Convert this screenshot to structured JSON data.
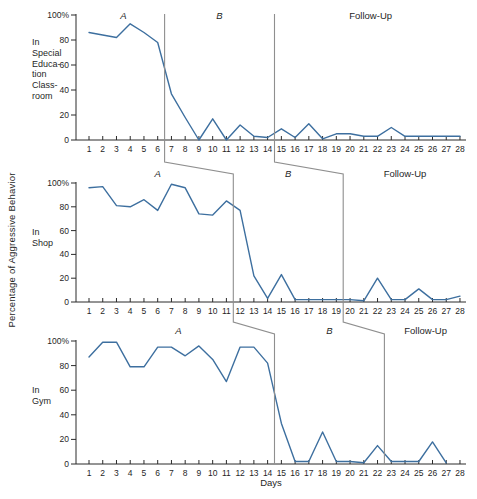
{
  "chart_data": {
    "type": "line",
    "title": "",
    "xlabel": "Days",
    "ylabel": "Percentage of Aggressive Behavior",
    "ylim": [
      0,
      100
    ],
    "grid": false,
    "legend": "none",
    "x_days": [
      1,
      2,
      3,
      4,
      5,
      6,
      7,
      8,
      9,
      10,
      11,
      12,
      13,
      14,
      15,
      16,
      17,
      18,
      19,
      20,
      21,
      22,
      23,
      24,
      25,
      26,
      27,
      28
    ],
    "y_ticks": [
      {
        "label": "100%",
        "value": 100
      },
      {
        "label": "80",
        "value": 80
      },
      {
        "label": "60",
        "value": 60
      },
      {
        "label": "40",
        "value": 40
      },
      {
        "label": "20",
        "value": 20
      },
      {
        "label": "0",
        "value": 0
      }
    ],
    "colors": {
      "line": "#3d6f9f",
      "axis": "#2b2b2b",
      "phase_line": "#8f8f8f",
      "text": "#1f1f1f",
      "background": "#ffffff"
    },
    "panels": [
      {
        "setting_label": "In\nSpecial\nEduca-\ntion\nClass-\nroom",
        "phases": [
          {
            "label": "A",
            "start_day": 1,
            "end_day": 6
          },
          {
            "label": "B",
            "start_day": 7,
            "end_day": 14
          },
          {
            "label": "Follow-Up",
            "start_day": 15,
            "end_day": 28
          }
        ],
        "phase_boundaries_after_day": [
          6,
          14
        ],
        "values": [
          86,
          84,
          82,
          93,
          86,
          78,
          37,
          18,
          0,
          17,
          0,
          12,
          3,
          2,
          9,
          2,
          13,
          1,
          5,
          5,
          3,
          3,
          10,
          3,
          3,
          3,
          3,
          3
        ]
      },
      {
        "setting_label": "In\nShop",
        "phases": [
          {
            "label": "A",
            "start_day": 1,
            "end_day": 11
          },
          {
            "label": "B",
            "start_day": 12,
            "end_day": 19
          },
          {
            "label": "Follow-Up",
            "start_day": 20,
            "end_day": 28
          }
        ],
        "phase_boundaries_after_day": [
          11,
          19
        ],
        "values": [
          96,
          97,
          81,
          80,
          86,
          77,
          99,
          96,
          74,
          73,
          85,
          77,
          22,
          3,
          23,
          2,
          2,
          2,
          2,
          2,
          1,
          20,
          2,
          2,
          11,
          2,
          2,
          5
        ]
      },
      {
        "setting_label": "In\nGym",
        "phases": [
          {
            "label": "A",
            "start_day": 1,
            "end_day": 14
          },
          {
            "label": "B",
            "start_day": 15,
            "end_day": 22
          },
          {
            "label": "Follow-Up",
            "start_day": 23,
            "end_day": 28
          }
        ],
        "phase_boundaries_after_day": [
          14,
          22
        ],
        "values": [
          87,
          99,
          99,
          79,
          79,
          95,
          95,
          88,
          96,
          85,
          67,
          95,
          95,
          82,
          33,
          2,
          2,
          26,
          2,
          2,
          1,
          15,
          2,
          2,
          2,
          18,
          1,
          null
        ]
      }
    ]
  }
}
